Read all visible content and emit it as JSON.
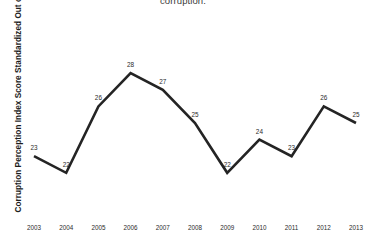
{
  "chart_data": {
    "type": "line",
    "title": "corruption.",
    "title_clipped": true,
    "xlabel": "",
    "ylabel": "Corruption Perception Index Score Standardized Out of 100",
    "categories": [
      "2003",
      "2004",
      "2005",
      "2006",
      "2007",
      "2008",
      "2009",
      "2010",
      "2011",
      "2012",
      "2013"
    ],
    "values": [
      23,
      22,
      26,
      28,
      27,
      25,
      22,
      24,
      23,
      26,
      25
    ],
    "data_labels": [
      "23",
      "22",
      "26",
      "28",
      "27",
      "25",
      "22",
      "24",
      "23",
      "26",
      "25"
    ],
    "series": [
      {
        "name": "Corruption Perception Index",
        "values": [
          23,
          22,
          26,
          28,
          27,
          25,
          22,
          24,
          23,
          26,
          25
        ]
      }
    ],
    "ylim": [
      20,
      30
    ],
    "grid": false,
    "legend": false,
    "axis_lines": false,
    "tick_marks": false,
    "markers": false,
    "line_color": "#242424",
    "label_color": "#2b2b2b",
    "background": "#ffffff"
  }
}
